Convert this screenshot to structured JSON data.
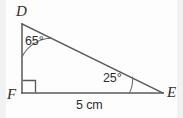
{
  "figure": {
    "type": "right-triangle-geometry-diagram",
    "background_color": "#fdfdfd",
    "stroke_color": "#58585a",
    "text_color": "#2e2e30",
    "vertices": [
      {
        "id": "D",
        "label": "D",
        "x": 22,
        "y": 24
      },
      {
        "id": "F",
        "label": "F",
        "x": 22,
        "y": 93
      },
      {
        "id": "E",
        "label": "E",
        "x": 163,
        "y": 93
      }
    ],
    "edges": [
      {
        "id": "DF",
        "from": "D",
        "to": "F"
      },
      {
        "id": "FE",
        "from": "F",
        "to": "E"
      },
      {
        "id": "DE",
        "from": "D",
        "to": "E"
      }
    ],
    "angles": [
      {
        "at": "D",
        "label": "65°",
        "value": 65,
        "marker": "arc"
      },
      {
        "at": "E",
        "label": "25°",
        "value": 25,
        "marker": "arc"
      },
      {
        "at": "F",
        "label": "",
        "value": 90,
        "marker": "right-angle-square"
      }
    ],
    "side_labels": [
      {
        "edge": "FE",
        "label": "5 cm",
        "value": 5,
        "unit": "cm"
      }
    ]
  }
}
